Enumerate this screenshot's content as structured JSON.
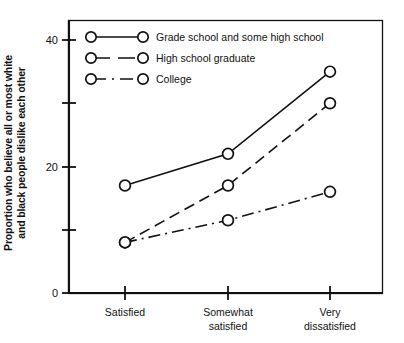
{
  "chart_data": {
    "type": "line",
    "title": "",
    "xlabel": "",
    "ylabel": "Proportion who believe all or most white and black people dislike each other",
    "ylabel_line1": "Proportion who believe all or most white",
    "ylabel_line2": "and black people dislike each other",
    "categories": [
      "Satisfied",
      "Somewhat satisfied",
      "Very dissatisfied"
    ],
    "category_labels": [
      {
        "line1": "Satisfied",
        "line2": ""
      },
      {
        "line1": "Somewhat",
        "line2": "satisfied"
      },
      {
        "line1": "Very",
        "line2": "dissatisfied"
      }
    ],
    "ylim": [
      0,
      44
    ],
    "yticks": [
      0,
      10,
      20,
      30,
      40
    ],
    "ytick_labels": [
      "0",
      "",
      "20",
      "",
      "40"
    ],
    "grid": false,
    "legend_position": "top-left-inside",
    "series": [
      {
        "name": "Grade school and some high school",
        "values": [
          17,
          22,
          35
        ],
        "line_style": "solid",
        "marker": "open-circle",
        "color": "#111111"
      },
      {
        "name": "High school graduate",
        "values": [
          8,
          17,
          30
        ],
        "line_style": "dashed",
        "marker": "open-circle",
        "color": "#111111"
      },
      {
        "name": "College",
        "values": [
          8,
          11.5,
          16
        ],
        "line_style": "dash-dot",
        "marker": "open-circle",
        "color": "#111111"
      }
    ]
  },
  "figure": {
    "background": "#ffffff",
    "foreground": "#111111"
  }
}
